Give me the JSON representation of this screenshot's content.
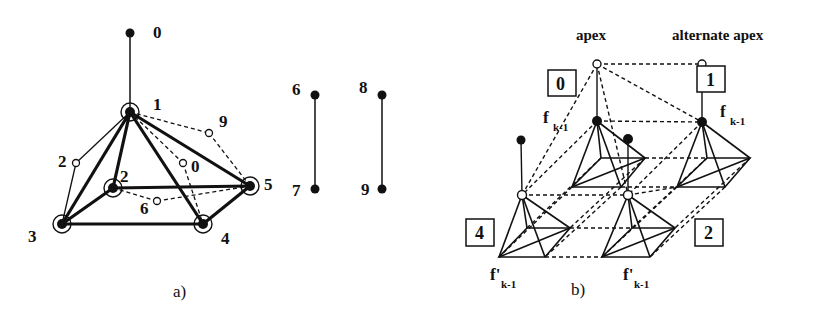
{
  "figure_a": {
    "caption": "a)",
    "node_labels": {
      "n0": "0",
      "n1": "1",
      "n2_open": "2",
      "n2": "2",
      "n0_open": "0",
      "n9_open": "9",
      "n6_open": "6",
      "n3": "3",
      "n4": "4",
      "n5": "5"
    },
    "edges_side": {
      "a_top": "6",
      "a_bottom": "7",
      "b_top": "8",
      "b_bottom": "9"
    }
  },
  "figure_b": {
    "caption": "b)",
    "apex_label": "apex",
    "alternate_apex_label": "alternate apex",
    "boxes": {
      "box0": "0",
      "box1": "1",
      "box2": "2",
      "box4": "4"
    },
    "face_labels": {
      "f_main": "f",
      "f_sub": "k-1",
      "fprime_main": "f'",
      "fprime_sub": "k-1"
    }
  },
  "colors": {
    "ink": "#111111",
    "background": "#ffffff"
  }
}
